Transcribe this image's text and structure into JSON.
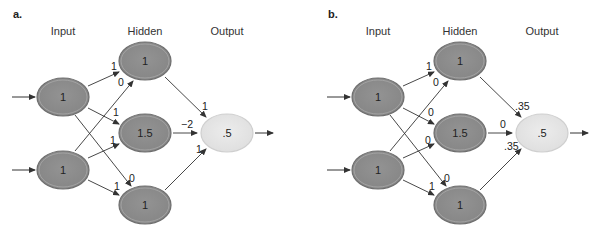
{
  "colors": {
    "node_fill": "#8a8a8a",
    "node_stroke": "#6e6e6e",
    "node_ring": "#b9b9b9",
    "output_fill": "#e4e4e4",
    "output_stroke": "#cfcfcf",
    "edge": "#333333"
  },
  "panels": [
    {
      "letter": "a.",
      "headers": {
        "input": "Input",
        "hidden": "Hidden",
        "output": "Output"
      },
      "inputs": [
        {
          "value": "1"
        },
        {
          "value": "1"
        }
      ],
      "hidden": [
        {
          "value": "1"
        },
        {
          "value": "1.5"
        },
        {
          "value": "1"
        }
      ],
      "output": {
        "value": ".5"
      },
      "weights_input_hidden": {
        "in1_h1": "1",
        "in2_h1": "0",
        "in1_h2": "1",
        "in2_h2": "1",
        "in1_h3": "0",
        "in2_h3": "1"
      },
      "weights_hidden_output": {
        "h1_out": "1",
        "h2_out": "−2",
        "h3_out": "1"
      }
    },
    {
      "letter": "b.",
      "headers": {
        "input": "Input",
        "hidden": "Hidden",
        "output": "Output"
      },
      "inputs": [
        {
          "value": "1"
        },
        {
          "value": "1"
        }
      ],
      "hidden": [
        {
          "value": "1"
        },
        {
          "value": "1.5"
        },
        {
          "value": "1"
        }
      ],
      "output": {
        "value": ".5"
      },
      "weights_input_hidden": {
        "in1_h1": "1",
        "in2_h1": "0",
        "in1_h2": "0",
        "in2_h2": "0",
        "in1_h3": "0",
        "in2_h3": "1"
      },
      "weights_hidden_output": {
        "h1_out": ".35",
        "h2_out": "0",
        "h3_out": ".35"
      }
    }
  ]
}
